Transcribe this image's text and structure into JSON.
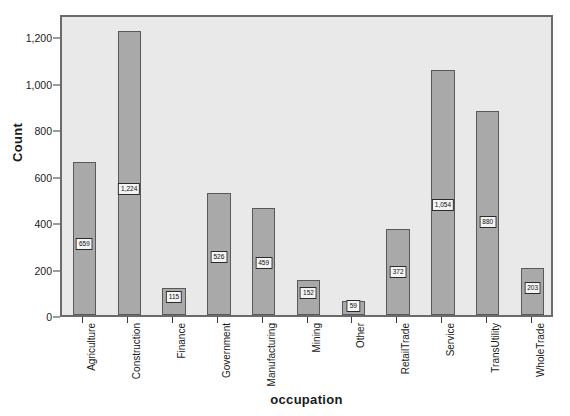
{
  "chart_data": {
    "type": "bar",
    "title": "",
    "xlabel": "occupation",
    "ylabel": "Count",
    "categories": [
      "Agriculture",
      "Construction",
      "Finance",
      "Government",
      "Manufacturing",
      "Mining",
      "Other",
      "RetailTrade",
      "Service",
      "TransUtility",
      "WholeTrade"
    ],
    "values": [
      659,
      1224,
      115,
      526,
      459,
      152,
      59,
      372,
      1054,
      880,
      203
    ],
    "data_labels": [
      "659",
      "1,224",
      "115",
      "526",
      "459",
      "152",
      "59",
      "372",
      "1,054",
      "880",
      "203"
    ],
    "ylim": [
      0,
      1300
    ],
    "yticks": [
      0,
      200,
      400,
      600,
      800,
      1000,
      1200
    ],
    "ytick_labels": [
      "0",
      "200",
      "400",
      "600",
      "800",
      "1,000",
      "1,200"
    ],
    "grid": false,
    "legend": "none",
    "bar_color": "#a9a9a9",
    "bar_border_color": "#595959",
    "plot_background": "#e9e9e9",
    "frame_color": "#6b6b6b"
  }
}
